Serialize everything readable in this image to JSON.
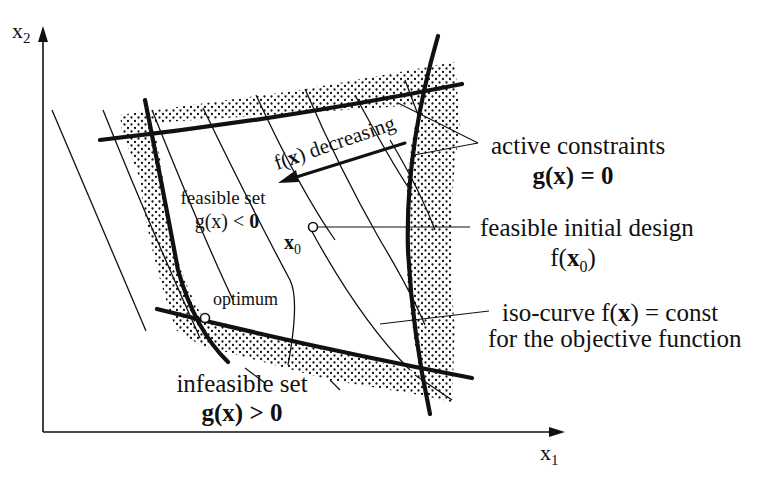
{
  "figure": {
    "colors": {
      "ink": "#111111",
      "background": "#ffffff",
      "infeasible_shading": "#111111"
    }
  },
  "axes": {
    "x_label_main": "x",
    "x_label_sub": "1",
    "y_label_main": "x",
    "y_label_sub": "2"
  },
  "labels": {
    "direction": {
      "f": "f(",
      "x": "x",
      "rest": ") decreasing"
    },
    "feasible_set": {
      "line1": "feasible set",
      "line2_a": "g(x) < ",
      "line2_b": "0"
    },
    "x0": {
      "main": "x",
      "sub": "0"
    },
    "optimum": "optimum",
    "infeasible_set": {
      "line1": "infeasible set",
      "line2": "g(x) > 0"
    },
    "active_constraints": {
      "line1": "active constraints",
      "line2": "g(x) = 0"
    },
    "initial_design": {
      "line1": "feasible initial design",
      "line2_a": "f(",
      "line2_x": "x",
      "line2_sub": "0",
      "line2_c": ")"
    },
    "iso_curve": {
      "line1_a": "iso-curve f(",
      "line1_x": "x",
      "line1_b": ") = const",
      "line2": "for the objective function"
    }
  }
}
